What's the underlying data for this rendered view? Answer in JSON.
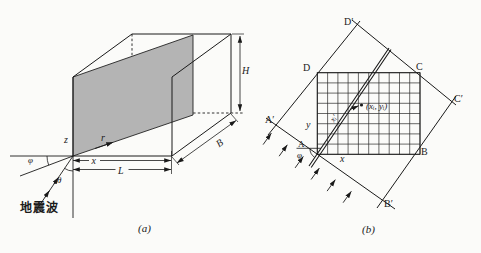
{
  "figure": {
    "background": "#fbfbf9",
    "line_color": "#1a1a1a",
    "plane_fill": "#b4b4b4",
    "panel_a": {
      "caption": "(a)",
      "labels": {
        "z_axis": "z",
        "r_axis": "r",
        "x_axis": "x",
        "length": "L",
        "width": "B",
        "height": "H",
        "phi": "φ",
        "theta": "θ",
        "seismic_wave": "地震波"
      }
    },
    "panel_b": {
      "caption": "(b)",
      "labels": {
        "corner_d_prime": "D′",
        "corner_d": "D",
        "corner_c": "C",
        "corner_c_prime": "C′",
        "corner_a_prime": "A′",
        "corner_a": "A",
        "corner_b": "B",
        "corner_b_prime": "B′",
        "x_axis": "x",
        "y_axis": "y",
        "grid_point": "(xᵢ, yᵢ)",
        "ray_distance": "xᵢ′",
        "phi": "φ"
      }
    }
  }
}
